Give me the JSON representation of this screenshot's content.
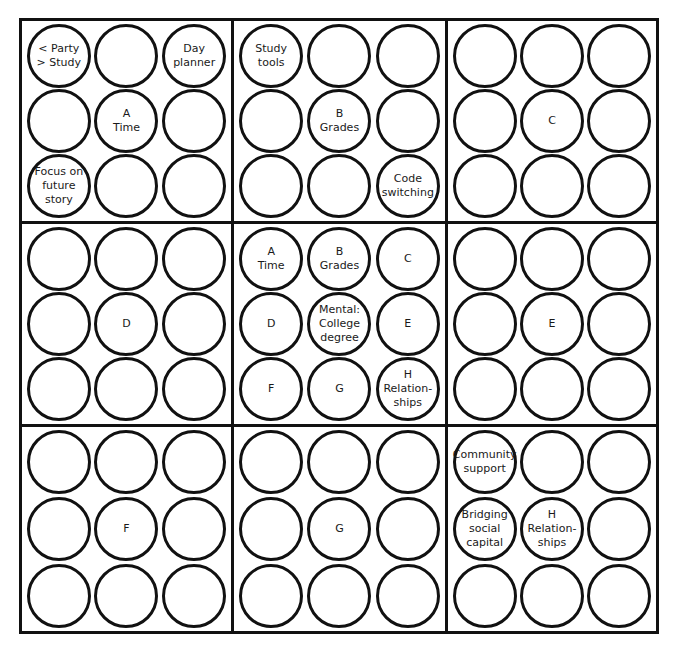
{
  "diagram": {
    "title_cut_off": "",
    "blocks": [
      {
        "id": "A-outer",
        "cells": [
          "< Party\n> Study",
          "",
          "Day\nplanner",
          "",
          "A\nTime",
          "",
          "Focus on\nfuture\nstory",
          "",
          ""
        ]
      },
      {
        "id": "B-outer",
        "cells": [
          "Study\ntools",
          "",
          "",
          "",
          "B\nGrades",
          "",
          "",
          "",
          "Code\nswitching"
        ]
      },
      {
        "id": "C-outer",
        "cells": [
          "",
          "",
          "",
          "",
          "C",
          "",
          "",
          "",
          ""
        ]
      },
      {
        "id": "D-outer",
        "cells": [
          "",
          "",
          "",
          "",
          "D",
          "",
          "",
          "",
          ""
        ]
      },
      {
        "id": "center",
        "cells": [
          "A\nTime",
          "B\nGrades",
          "C",
          "D",
          "Mental:\nCollege\ndegree",
          "E",
          "F",
          "G",
          "H\nRelation-\nships"
        ]
      },
      {
        "id": "E-outer",
        "cells": [
          "",
          "",
          "",
          "",
          "E",
          "",
          "",
          "",
          ""
        ]
      },
      {
        "id": "F-outer",
        "cells": [
          "",
          "",
          "",
          "",
          "F",
          "",
          "",
          "",
          ""
        ]
      },
      {
        "id": "G-outer",
        "cells": [
          "",
          "",
          "",
          "",
          "G",
          "",
          "",
          "",
          ""
        ]
      },
      {
        "id": "H-outer",
        "cells": [
          "Community\nsupport",
          "",
          "",
          "Bridging\nsocial\ncapital",
          "H\nRelation-\nships",
          "",
          "",
          "",
          ""
        ]
      }
    ]
  }
}
